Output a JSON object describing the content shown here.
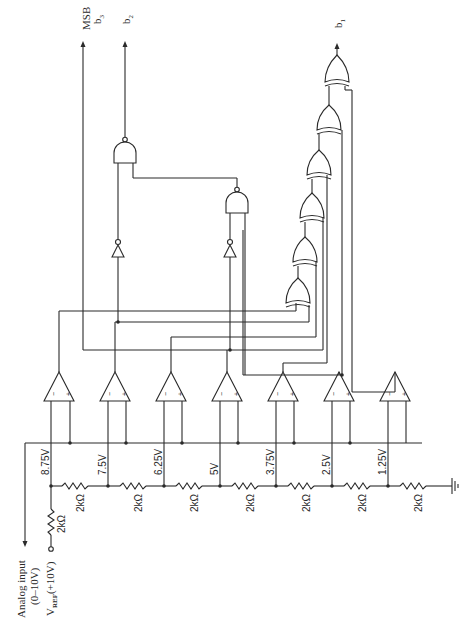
{
  "diagram": {
    "kind": "3-bit flash analog-to-digital converter schematic (rotated 90°)",
    "input": {
      "label_line1": "Analog input",
      "label_line2": "(0–10V)"
    },
    "reference": {
      "label_prefix": "V",
      "label_sub": "REF",
      "label_suffix": "(+10V)",
      "series_resistor": "2kΩ"
    },
    "ladder_resistors": [
      "2kΩ",
      "2kΩ",
      "2kΩ",
      "2kΩ",
      "2kΩ",
      "2kΩ",
      "2kΩ"
    ],
    "tap_voltages": [
      "8.75V",
      "7.5V",
      "6.25V",
      "5V",
      "3.75V",
      "2.5V",
      "1.25V"
    ],
    "comparators": [
      {
        "inv": "−",
        "noninv": "+"
      },
      {
        "inv": "−",
        "noninv": "+"
      },
      {
        "inv": "−",
        "noninv": "+"
      },
      {
        "inv": "−",
        "noninv": "+"
      },
      {
        "inv": "−",
        "noninv": "+"
      },
      {
        "inv": "−",
        "noninv": "+"
      },
      {
        "inv": "−",
        "noninv": "+"
      }
    ],
    "outputs": {
      "msb_label": "MSB",
      "b3": "b",
      "b3_sub": "3",
      "b2": "b",
      "b2_sub": "2",
      "b1": "b",
      "b1_sub": "1"
    },
    "gates": {
      "nand_count": 2,
      "inverter_count": 2,
      "xor_count": 6
    }
  }
}
